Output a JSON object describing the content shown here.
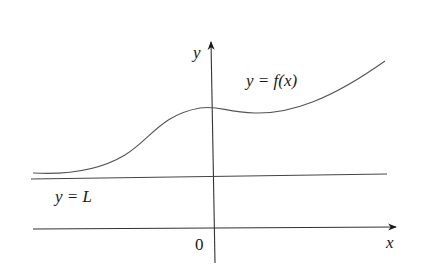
{
  "figure": {
    "type": "function-graph-with-horizontal-asymptote",
    "axes": {
      "x_label": "x",
      "y_label": "y",
      "origin_label": "0"
    },
    "curve": {
      "label": "y = f(x)",
      "description": "curve approaching y = L as x goes to negative infinity, local max near y-axis, shallow dip, then rising"
    },
    "asymptote": {
      "label": "y = L"
    },
    "colors": {
      "line": "#444444",
      "text": "#1a1a1a",
      "background": "#ffffff"
    }
  }
}
